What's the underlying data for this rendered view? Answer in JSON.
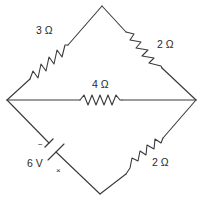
{
  "diagram": {
    "type": "circuit",
    "nodes": {
      "top": [
        102,
        6
      ],
      "left": [
        7,
        100
      ],
      "right": [
        196,
        100
      ],
      "bottom": [
        100,
        194
      ]
    },
    "components": [
      {
        "id": "R1",
        "kind": "resistor",
        "value": "3 Ω",
        "edge": "left-top"
      },
      {
        "id": "R2",
        "kind": "resistor",
        "value": "2 Ω",
        "edge": "top-right"
      },
      {
        "id": "R3",
        "kind": "resistor",
        "value": "4 Ω",
        "edge": "left-right"
      },
      {
        "id": "R4",
        "kind": "resistor",
        "value": "2 Ω",
        "edge": "right-bottom"
      },
      {
        "id": "B1",
        "kind": "battery",
        "value": "6 V",
        "edge": "left-bottom"
      }
    ],
    "labels": {
      "r_upper_left": "3 Ω",
      "r_upper_right": "2 Ω",
      "r_middle": "4 Ω",
      "r_lower_right": "2 Ω",
      "battery": "6 V",
      "battery_minus": "−",
      "battery_plus": "×"
    }
  }
}
